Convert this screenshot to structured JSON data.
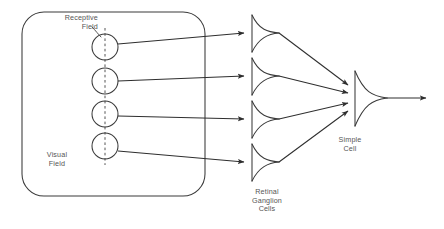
{
  "diagram": {
    "type": "neural-schematic",
    "canvas": {
      "width": 444,
      "height": 229
    },
    "colors": {
      "background": "#ffffff",
      "stroke": "#3a3a3a",
      "text": "#555555",
      "arrow": "#2e2e2e"
    },
    "labels": {
      "receptive_field": "Receptive\nField",
      "visual_field": "Visual\nField",
      "retinal_ganglion_cells": "Retinal\nGanglion\nCells",
      "simple_cell": "Simple\nCell"
    },
    "visual_field_box": {
      "x": 22,
      "y": 12,
      "width": 183,
      "height": 184,
      "corner_radius": 22
    },
    "receptive_fields": [
      {
        "cx": 105,
        "cy": 47,
        "r": 13
      },
      {
        "cx": 105,
        "cy": 81,
        "r": 13
      },
      {
        "cx": 105,
        "cy": 114,
        "r": 13
      },
      {
        "cx": 105,
        "cy": 146,
        "r": 13
      }
    ],
    "orientation_axis": {
      "x": 105,
      "y_top": 28,
      "y_bottom": 165
    },
    "ganglion_cells": [
      {
        "x": 252,
        "y": 33
      },
      {
        "x": 252,
        "y": 76
      },
      {
        "x": 252,
        "y": 119
      },
      {
        "x": 252,
        "y": 162
      }
    ],
    "simple_cell": {
      "x": 355,
      "y": 98
    },
    "output_axon": {
      "x1": 372,
      "y1": 98,
      "x2": 428,
      "y2": 98
    },
    "counts": {
      "receptive_fields": 4,
      "ganglion_cells": 4,
      "simple_cells": 1
    }
  }
}
